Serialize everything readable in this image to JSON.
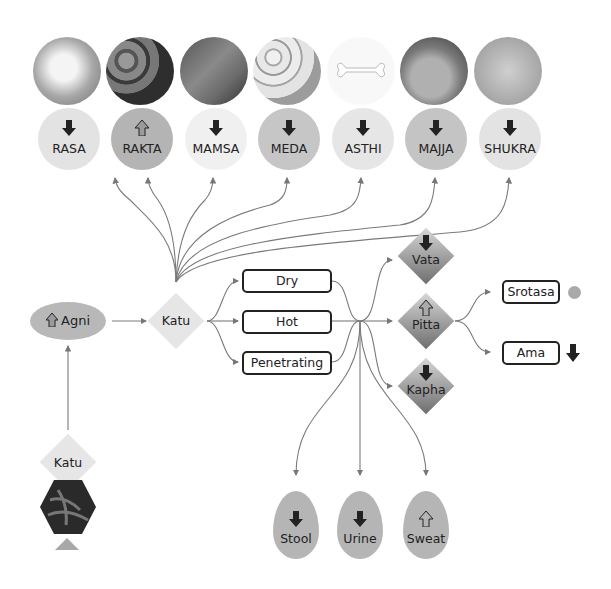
{
  "dhatus": [
    {
      "label": "RASA",
      "effect": "decrease",
      "bg": "#e3e3e3",
      "photo": [
        "#e9e9e9",
        "#9a9a9a"
      ]
    },
    {
      "label": "RAKTA",
      "effect": "increase",
      "bg": "#b4b4b4",
      "photo": [
        "#8a8a8a",
        "#2e2e2e"
      ]
    },
    {
      "label": "MAMSA",
      "effect": "decrease",
      "bg": "#f0f0f0",
      "photo": [
        "#7a7a7a",
        "#3a3a3a"
      ]
    },
    {
      "label": "MEDA",
      "effect": "decrease",
      "bg": "#c6c6c6",
      "photo": [
        "#e4e4e4",
        "#9c9c9c"
      ]
    },
    {
      "label": "ASTHI",
      "effect": "decrease",
      "bg": "#e6e6e6",
      "photo": [
        "#fafafa",
        "#f2f2f2"
      ]
    },
    {
      "label": "MAJJA",
      "effect": "decrease",
      "bg": "#c4c4c4",
      "photo": [
        "#9a9a9a",
        "#3e3e3e"
      ]
    },
    {
      "label": "SHUKRA",
      "effect": "decrease",
      "bg": "#e3e3e3",
      "photo": [
        "#c4c4c4",
        "#a0a0a0"
      ]
    }
  ],
  "agni": {
    "label": "Agni",
    "effect": "increase"
  },
  "katu_center": {
    "label": "Katu"
  },
  "katu_source": {
    "label": "Katu"
  },
  "qualities": [
    {
      "label": "Dry"
    },
    {
      "label": "Hot"
    },
    {
      "label": "Penetrating"
    }
  ],
  "doshas": [
    {
      "label": "Vata",
      "effect": "decrease"
    },
    {
      "label": "Pitta",
      "effect": "increase"
    },
    {
      "label": "Kapha",
      "effect": "decrease"
    }
  ],
  "pitta_effects": [
    {
      "label": "Srotasa",
      "effect": "neutral"
    },
    {
      "label": "Ama",
      "effect": "decrease"
    }
  ],
  "malas": [
    {
      "label": "Stool",
      "effect": "decrease"
    },
    {
      "label": "Urine",
      "effect": "decrease"
    },
    {
      "label": "Sweat",
      "effect": "increase"
    }
  ]
}
